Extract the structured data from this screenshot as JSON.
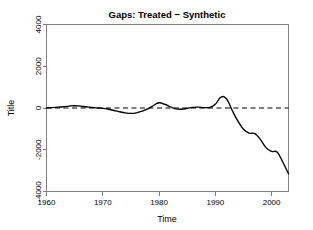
{
  "chart_data": {
    "type": "line",
    "title": "Gaps: Treated − Synthetic",
    "xlabel": "Time",
    "ylabel": "Title",
    "xlim": [
      1960,
      2003
    ],
    "ylim": [
      -4000,
      4000
    ],
    "xticks": [
      1960,
      1970,
      1980,
      1990,
      2000
    ],
    "xtick_labels": [
      "1960",
      "1970",
      "1980",
      "1990",
      "2000"
    ],
    "yticks": [
      -4000,
      -2000,
      0,
      2000,
      4000
    ],
    "ytick_labels": [
      "-4000",
      "-2000",
      "0",
      "2000",
      "4000"
    ],
    "grid": false,
    "legend": null,
    "series": [
      {
        "name": "gap",
        "style": "solid",
        "color": "#000000",
        "x": [
          1960,
          1961,
          1962,
          1963,
          1964,
          1965,
          1966,
          1967,
          1968,
          1969,
          1970,
          1971,
          1972,
          1973,
          1974,
          1975,
          1976,
          1977,
          1978,
          1979,
          1980,
          1981,
          1982,
          1983,
          1984,
          1985,
          1986,
          1987,
          1988,
          1989,
          1990,
          1991,
          1992,
          1993,
          1994,
          1995,
          1996,
          1997,
          1998,
          1999,
          2000,
          2001,
          2002,
          2003
        ],
        "values": [
          0,
          20,
          40,
          60,
          90,
          110,
          90,
          60,
          30,
          0,
          -20,
          -60,
          -120,
          -180,
          -230,
          -260,
          -230,
          -150,
          -40,
          120,
          250,
          180,
          60,
          -40,
          -60,
          -20,
          30,
          40,
          20,
          30,
          180,
          520,
          430,
          -120,
          -620,
          -1020,
          -1200,
          -1230,
          -1500,
          -1900,
          -2080,
          -2120,
          -2600,
          -3150
        ]
      },
      {
        "name": "zero-reference",
        "style": "dashed",
        "color": "#000000",
        "x": [
          1960,
          2003
        ],
        "values": [
          0,
          0
        ]
      }
    ],
    "annotations": []
  },
  "figure": {
    "title": "Gaps: Treated − Synthetic",
    "x_axis_label": "Time",
    "y_axis_label": "Title",
    "background_color": "#ffffff",
    "axis_color": "#808080",
    "line_color": "#000000"
  }
}
